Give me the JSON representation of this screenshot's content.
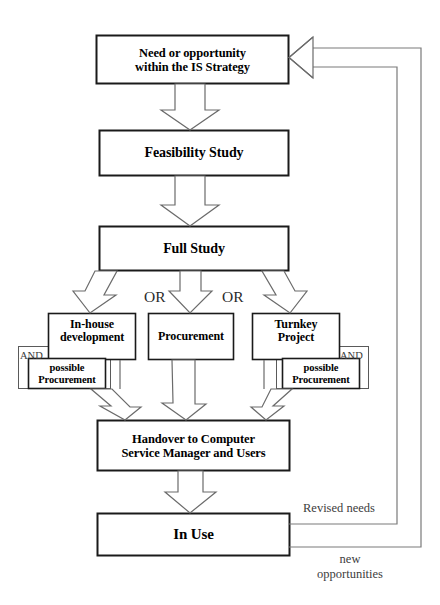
{
  "diagram": {
    "colors": {
      "box_stroke": "#1a1a1a",
      "thin_stroke": "#5a5a5a",
      "arrow_stroke": "#6b6b6b",
      "line_stroke": "#7a7a7a",
      "text": "#000000",
      "background": "#ffffff"
    },
    "nodes": {
      "need": {
        "line1": "Need or opportunity",
        "line2": "within the IS Strategy"
      },
      "feasibility": {
        "label": "Feasibility Study"
      },
      "full_study": {
        "label": "Full Study"
      },
      "inhouse": {
        "line1": "In-house",
        "line2": "development"
      },
      "procurement": {
        "label": "Procurement"
      },
      "turnkey": {
        "line1": "Turnkey",
        "line2": "Project"
      },
      "possible_left": {
        "line1": "possible",
        "line2": "Procurement"
      },
      "possible_right": {
        "line1": "possible",
        "line2": "Procurement"
      },
      "handover": {
        "line1": "Handover to Computer",
        "line2": "Service Manager and Users"
      },
      "in_use": {
        "label": "In Use"
      }
    },
    "connector_labels": {
      "and_left": "AND",
      "and_right": "AND",
      "or_first": "OR",
      "or_second": "OR",
      "revised_needs": "Revised needs",
      "new_opportunities_line1": "new",
      "new_opportunities_line2": "opportunities"
    }
  }
}
